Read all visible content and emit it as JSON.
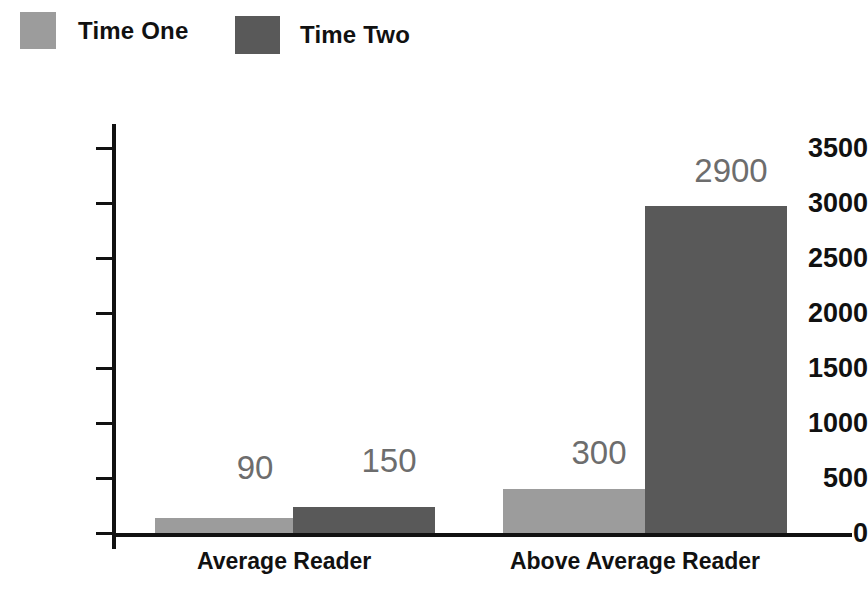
{
  "chart_data": {
    "type": "bar",
    "title": "",
    "subtitle": "",
    "xlabel": "",
    "ylabel": "",
    "categories": [
      "Average Reader",
      "Above Average Reader"
    ],
    "series": [
      {
        "name": "Time One",
        "color": "#9c9c9c",
        "values": [
          90,
          300
        ],
        "value_labels": [
          "90",
          "300"
        ]
      },
      {
        "name": "Time Two",
        "color": "#595959",
        "values": [
          150,
          2900
        ],
        "value_labels": [
          "150",
          "2900"
        ]
      }
    ],
    "ylim": [
      0,
      3500
    ],
    "yticks": [
      0,
      500,
      1000,
      1500,
      2000,
      2500,
      3000,
      3500
    ],
    "ytick_labels": [
      "0",
      "500",
      "1000",
      "1500",
      "2000",
      "2500",
      "3000",
      "3500"
    ],
    "grid": false,
    "legend_position": "top-left",
    "legend": [
      {
        "label": "Time One",
        "swatch": "legend-swatch-light"
      },
      {
        "label": "Time Two",
        "swatch": "legend-swatch-dark"
      }
    ],
    "colors": {
      "time_one": "#9c9c9c",
      "time_two": "#595959",
      "axis": "#111111",
      "value_label": "#6d6d6d",
      "background": "#ffffff"
    },
    "drawn_bars": [
      {
        "series": "Time One",
        "category": "Average Reader",
        "left": 155,
        "width": 138,
        "top": 518,
        "label": "90",
        "label_x": 186,
        "label_y": 449
      },
      {
        "series": "Time Two",
        "category": "Average Reader",
        "left": 293,
        "width": 142,
        "top": 507,
        "label": "150",
        "label_x": 318,
        "label_y": 442
      },
      {
        "series": "Time One",
        "category": "Above Average Reader",
        "left": 503,
        "width": 142,
        "top": 489,
        "label": "300",
        "label_x": 528,
        "label_y": 434
      },
      {
        "series": "Time Two",
        "category": "Above Average Reader",
        "left": 645,
        "width": 142,
        "top": 206,
        "label": "2900",
        "label_x": 660,
        "label_y": 152
      }
    ],
    "category_label_positions": [
      {
        "label": "Average Reader",
        "left": 197,
        "width": 140
      },
      {
        "label": "Above Average Reader",
        "left": 489,
        "width": 292
      }
    ]
  }
}
